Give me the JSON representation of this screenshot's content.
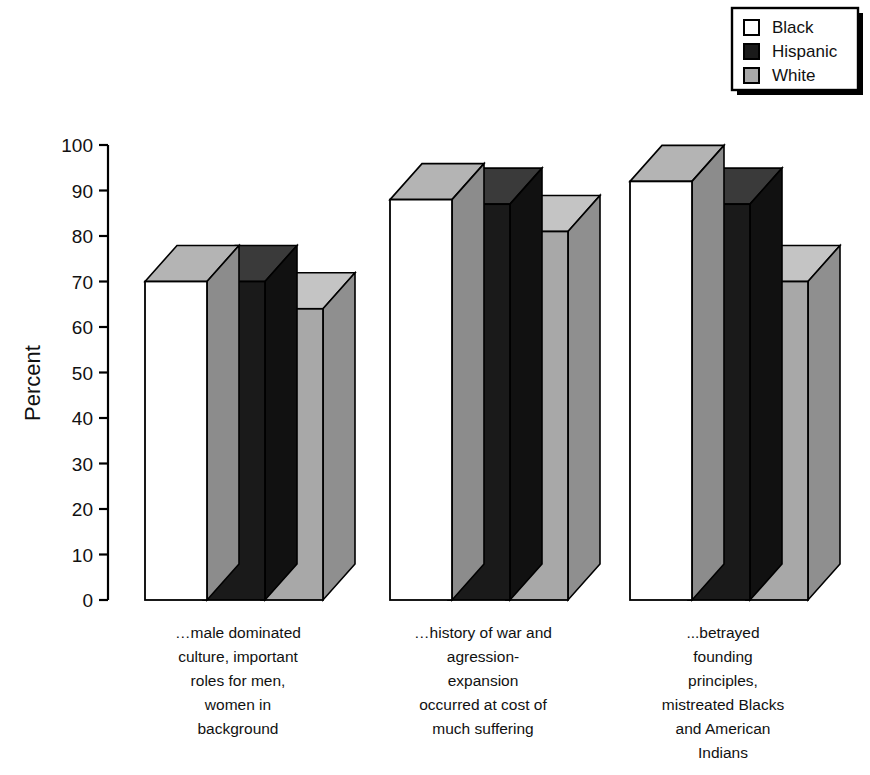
{
  "chart_data": {
    "type": "bar",
    "title": "",
    "subtitle": "",
    "xlabel": "",
    "ylabel": "Percent",
    "ylim": [
      0,
      100
    ],
    "yticks": [
      0,
      10,
      20,
      30,
      40,
      50,
      60,
      70,
      80,
      90,
      100
    ],
    "ytick_labels": [
      "0",
      "10",
      "20",
      "30",
      "40",
      "50",
      "60",
      "70",
      "80",
      "90",
      "100"
    ],
    "grid": false,
    "three_d": true,
    "legend_position": "top-right",
    "categories": [
      "…male dominated culture, important roles for men, women in background",
      "…history of war and agression-expansion occurred at cost of much suffering",
      "...betrayed founding principles, mistreated Blacks and American Indians"
    ],
    "category_lines": [
      [
        "…male dominated",
        "culture, important",
        "roles for men,",
        "women in",
        "background"
      ],
      [
        "…history of war and",
        "agression-",
        "expansion",
        "occurred at cost of",
        "much suffering"
      ],
      [
        "...betrayed",
        "founding",
        "principles,",
        "mistreated Blacks",
        "and American",
        "Indians"
      ]
    ],
    "series": [
      {
        "name": "Black",
        "values": [
          70,
          88,
          92
        ],
        "color": "#ffffff",
        "top_color": "#b4b4b4",
        "side_color": "#8c8c8c"
      },
      {
        "name": "Hispanic",
        "values": [
          70,
          87,
          87
        ],
        "color": "#1a1a1a",
        "top_color": "#3a3a3a",
        "side_color": "#111111"
      },
      {
        "name": "White",
        "values": [
          64,
          81,
          70
        ],
        "color": "#a8a8a8",
        "top_color": "#c4c4c4",
        "side_color": "#8f8f8f"
      }
    ]
  },
  "legend": {
    "items": [
      {
        "label": "Black",
        "swatch": "#ffffff"
      },
      {
        "label": "Hispanic",
        "swatch": "#1a1a1a"
      },
      {
        "label": "White",
        "swatch": "#a8a8a8"
      }
    ]
  },
  "axis": {
    "y_title": "Percent"
  }
}
